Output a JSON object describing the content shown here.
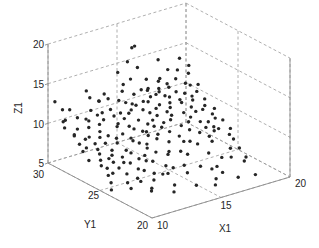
{
  "chart_data": {
    "type": "scatter3d",
    "title": "",
    "xlabel": "X1",
    "ylabel": "Y1",
    "zlabel": "Z1",
    "xlim": [
      10,
      20
    ],
    "ylim": [
      20,
      30
    ],
    "zlim": [
      5,
      20
    ],
    "xticks": [
      "10",
      "15",
      "20"
    ],
    "yticks": [
      "20",
      "25",
      "30"
    ],
    "zticks": [
      "5",
      "10",
      "15",
      "20"
    ],
    "grid": true,
    "marker_color": "#262626",
    "points": [
      [
        10.2,
        29.6,
        12.9
      ],
      [
        10.5,
        29.2,
        10.5
      ],
      [
        10.3,
        28.8,
        10.1
      ],
      [
        10.8,
        29.4,
        10.4
      ],
      [
        11.0,
        28.5,
        9.8
      ],
      [
        10.4,
        28.0,
        9.6
      ],
      [
        10.9,
        27.6,
        9.2
      ],
      [
        11.3,
        28.9,
        10.8
      ],
      [
        11.6,
        28.2,
        9.9
      ],
      [
        12.0,
        29.0,
        10.2
      ],
      [
        10.6,
        27.1,
        8.6
      ],
      [
        11.2,
        26.8,
        8.3
      ],
      [
        11.8,
        27.4,
        9.1
      ],
      [
        12.3,
        28.1,
        10.0
      ],
      [
        12.6,
        28.7,
        10.6
      ],
      [
        10.1,
        26.2,
        7.9
      ],
      [
        10.7,
        25.8,
        7.2
      ],
      [
        11.4,
        26.0,
        7.6
      ],
      [
        12.0,
        26.5,
        8.0
      ],
      [
        12.7,
        27.0,
        8.8
      ],
      [
        13.2,
        27.6,
        9.6
      ],
      [
        13.5,
        28.3,
        10.3
      ],
      [
        13.0,
        29.1,
        11.9
      ],
      [
        12.4,
        29.5,
        13.2
      ],
      [
        14.3,
        29.0,
        14.9
      ],
      [
        11.0,
        25.1,
        6.6
      ],
      [
        11.8,
        24.8,
        6.3
      ],
      [
        12.5,
        25.4,
        6.9
      ],
      [
        13.0,
        26.0,
        7.5
      ],
      [
        13.6,
        26.8,
        8.5
      ],
      [
        14.0,
        27.5,
        9.3
      ],
      [
        14.5,
        28.2,
        10.2
      ],
      [
        14.8,
        28.9,
        10.9
      ],
      [
        15.0,
        29.5,
        11.8
      ],
      [
        15.3,
        29.8,
        12.3
      ],
      [
        12.2,
        24.3,
        5.9
      ],
      [
        12.9,
        24.6,
        6.3
      ],
      [
        13.5,
        25.2,
        6.8
      ],
      [
        14.1,
        25.9,
        7.6
      ],
      [
        14.7,
        26.6,
        8.4
      ],
      [
        15.2,
        27.3,
        9.1
      ],
      [
        15.8,
        27.9,
        9.8
      ],
      [
        16.2,
        28.6,
        10.5
      ],
      [
        16.6,
        29.2,
        11.3
      ],
      [
        13.8,
        24.0,
        5.8
      ],
      [
        14.4,
        24.5,
        6.2
      ],
      [
        15.0,
        25.1,
        6.9
      ],
      [
        15.6,
        25.8,
        7.7
      ],
      [
        16.1,
        26.4,
        8.3
      ],
      [
        16.7,
        27.1,
        9.0
      ],
      [
        17.2,
        27.8,
        9.8
      ],
      [
        17.6,
        28.4,
        10.5
      ],
      [
        18.0,
        29.0,
        11.1
      ],
      [
        15.5,
        24.2,
        5.9
      ],
      [
        16.2,
        24.8,
        6.5
      ],
      [
        16.9,
        25.5,
        7.3
      ],
      [
        17.4,
        26.2,
        8.0
      ],
      [
        18.0,
        26.9,
        8.8
      ],
      [
        18.5,
        27.5,
        9.4
      ],
      [
        19.0,
        28.1,
        10.1
      ],
      [
        19.4,
        28.8,
        10.8
      ],
      [
        17.5,
        24.5,
        6.2
      ],
      [
        18.2,
        25.1,
        6.9
      ],
      [
        18.8,
        25.7,
        7.5
      ],
      [
        19.4,
        26.4,
        8.3
      ],
      [
        19.8,
        27.0,
        8.9
      ],
      [
        19.0,
        24.4,
        6.1
      ],
      [
        19.6,
        24.9,
        6.6
      ],
      [
        19.9,
        25.6,
        7.3
      ],
      [
        18.6,
        23.8,
        5.6
      ],
      [
        10.3,
        24.3,
        5.4
      ],
      [
        11.2,
        23.6,
        5.6
      ],
      [
        12.4,
        23.2,
        5.3
      ],
      [
        13.6,
        22.6,
        5.5
      ],
      [
        14.8,
        22.1,
        5.2
      ],
      [
        16.0,
        21.8,
        5.6
      ],
      [
        17.3,
        21.4,
        5.4
      ],
      [
        18.4,
        21.2,
        5.3
      ],
      [
        13.1,
        22.0,
        5.3
      ],
      [
        15.5,
        21.2,
        5.5
      ],
      [
        17.0,
        22.5,
        5.4
      ],
      [
        18.8,
        22.8,
        5.7
      ],
      [
        19.3,
        23.3,
        5.6
      ],
      [
        16.6,
        23.0,
        5.7
      ],
      [
        12.0,
        22.7,
        5.5
      ],
      [
        10.9,
        29.8,
        11.4
      ],
      [
        11.5,
        29.9,
        11.0
      ],
      [
        12.8,
        29.7,
        12.0
      ],
      [
        13.9,
        29.4,
        11.5
      ],
      [
        15.9,
        29.9,
        12.6
      ],
      [
        16.9,
        29.7,
        12.2
      ],
      [
        17.8,
        29.6,
        11.9
      ],
      [
        18.6,
        29.9,
        12.4
      ],
      [
        19.3,
        29.7,
        13.6
      ],
      [
        19.6,
        29.2,
        12.9
      ],
      [
        17.9,
        29.9,
        14.0
      ],
      [
        16.4,
        29.9,
        13.8
      ],
      [
        15.6,
        29.8,
        15.0
      ],
      [
        16.0,
        29.9,
        16.5
      ],
      [
        16.2,
        29.9,
        16.6
      ],
      [
        10.7,
        28.4,
        9.3
      ],
      [
        11.4,
        27.9,
        9.0
      ],
      [
        12.1,
        27.8,
        9.4
      ],
      [
        12.9,
        28.5,
        10.0
      ],
      [
        13.7,
        28.9,
        10.6
      ],
      [
        14.2,
        28.6,
        10.1
      ],
      [
        14.9,
        27.8,
        9.4
      ],
      [
        15.4,
        28.7,
        10.4
      ],
      [
        16.1,
        27.6,
        9.5
      ],
      [
        16.8,
        28.3,
        10.0
      ],
      [
        17.5,
        29.3,
        11.0
      ],
      [
        18.3,
        28.7,
        10.6
      ],
      [
        18.9,
        27.9,
        9.8
      ],
      [
        19.5,
        28.3,
        10.3
      ],
      [
        19.8,
        29.5,
        11.6
      ],
      [
        10.4,
        27.5,
        8.9
      ],
      [
        11.1,
        26.5,
        8.0
      ],
      [
        11.7,
        26.1,
        7.8
      ],
      [
        12.6,
        26.8,
        8.4
      ],
      [
        13.3,
        27.2,
        8.9
      ],
      [
        13.9,
        26.4,
        8.0
      ],
      [
        14.6,
        27.0,
        8.7
      ],
      [
        15.1,
        26.3,
        8.0
      ],
      [
        15.9,
        26.9,
        8.6
      ],
      [
        16.5,
        26.0,
        7.8
      ],
      [
        17.1,
        26.6,
        8.4
      ],
      [
        17.8,
        27.3,
        9.2
      ],
      [
        18.4,
        26.5,
        8.3
      ],
      [
        19.1,
        27.2,
        9.0
      ],
      [
        19.7,
        27.8,
        9.6
      ],
      [
        10.9,
        25.5,
        7.0
      ],
      [
        11.6,
        25.3,
        6.8
      ],
      [
        12.3,
        25.9,
        7.4
      ],
      [
        13.2,
        25.5,
        7.0
      ],
      [
        13.9,
        25.1,
        6.6
      ],
      [
        14.5,
        25.6,
        7.1
      ],
      [
        15.3,
        25.4,
        6.9
      ],
      [
        16.0,
        25.2,
        6.7
      ],
      [
        16.6,
        25.7,
        7.3
      ],
      [
        17.3,
        25.3,
        6.9
      ],
      [
        17.9,
        25.9,
        7.6
      ],
      [
        18.5,
        26.1,
        7.8
      ],
      [
        19.2,
        25.8,
        7.5
      ],
      [
        19.8,
        26.2,
        8.0
      ],
      [
        10.2,
        26.9,
        8.5
      ],
      [
        12.2,
        24.0,
        5.7
      ],
      [
        13.0,
        23.8,
        5.6
      ],
      [
        14.1,
        23.9,
        5.8
      ],
      [
        15.2,
        23.5,
        5.6
      ],
      [
        16.3,
        23.7,
        5.7
      ],
      [
        17.2,
        23.3,
        5.5
      ],
      [
        18.0,
        23.9,
        5.8
      ],
      [
        19.5,
        24.2,
        6.0
      ],
      [
        14.7,
        24.2,
        6.0
      ],
      [
        13.4,
        24.3,
        5.9
      ],
      [
        11.9,
        28.6,
        10.3
      ],
      [
        12.5,
        29.2,
        10.9
      ],
      [
        13.1,
        28.9,
        10.5
      ],
      [
        13.4,
        29.6,
        11.3
      ],
      [
        14.0,
        29.9,
        11.7
      ],
      [
        14.6,
        29.3,
        11.0
      ],
      [
        15.2,
        28.8,
        10.6
      ],
      [
        15.7,
        29.3,
        11.2
      ],
      [
        16.3,
        29.4,
        11.4
      ],
      [
        17.0,
        28.9,
        10.8
      ],
      [
        17.4,
        28.1,
        10.1
      ],
      [
        18.1,
        27.9,
        9.9
      ],
      [
        18.7,
        28.4,
        10.4
      ],
      [
        19.2,
        29.0,
        11.0
      ],
      [
        19.9,
        28.7,
        10.7
      ],
      [
        10.6,
        25.0,
        6.6
      ],
      [
        10.5,
        24.6,
        6.0
      ],
      [
        11.4,
        24.2,
        5.8
      ],
      [
        12.7,
        24.9,
        6.4
      ],
      [
        13.7,
        25.6,
        7.1
      ],
      [
        14.3,
        26.2,
        7.8
      ],
      [
        15.4,
        26.6,
        8.2
      ],
      [
        15.7,
        27.5,
        9.2
      ],
      [
        16.4,
        28.1,
        9.9
      ],
      [
        17.0,
        27.4,
        9.2
      ],
      [
        17.7,
        26.7,
        8.5
      ],
      [
        18.3,
        25.5,
        7.2
      ],
      [
        18.9,
        26.4,
        8.1
      ],
      [
        19.4,
        27.4,
        9.2
      ],
      [
        19.6,
        25.3,
        6.9
      ],
      [
        11.3,
        27.2,
        8.7
      ],
      [
        11.9,
        27.0,
        8.6
      ],
      [
        12.4,
        27.4,
        9.0
      ],
      [
        13.5,
        27.9,
        9.6
      ],
      [
        14.1,
        28.1,
        9.8
      ],
      [
        14.9,
        28.5,
        10.2
      ],
      [
        15.6,
        28.3,
        10.0
      ],
      [
        16.0,
        28.8,
        10.5
      ],
      [
        16.6,
        28.9,
        10.7
      ],
      [
        17.3,
        29.0,
        10.9
      ],
      [
        18.1,
        29.3,
        11.3
      ],
      [
        18.8,
        29.4,
        11.5
      ],
      [
        19.3,
        29.9,
        12.0
      ],
      [
        17.7,
        29.6,
        11.6
      ],
      [
        16.8,
        29.4,
        11.3
      ],
      [
        10.8,
        26.0,
        7.7
      ],
      [
        11.5,
        25.7,
        7.3
      ],
      [
        12.1,
        25.5,
        7.1
      ],
      [
        12.8,
        26.2,
        7.8
      ],
      [
        13.6,
        26.6,
        8.3
      ],
      [
        14.2,
        27.3,
        9.0
      ],
      [
        14.8,
        26.9,
        8.6
      ],
      [
        15.5,
        27.1,
        8.8
      ],
      [
        16.2,
        27.1,
        8.9
      ],
      [
        16.9,
        27.7,
        9.5
      ],
      [
        17.5,
        28.7,
        10.5
      ],
      [
        18.2,
        28.2,
        10.0
      ],
      [
        18.6,
        27.2,
        9.0
      ],
      [
        19.0,
        26.0,
        7.7
      ],
      [
        19.5,
        26.8,
        8.5
      ]
    ]
  },
  "axes": {
    "zlabel": "Z1",
    "ylabel": "Y1",
    "xlabel": "X1",
    "zticks": [
      "5",
      "10",
      "15",
      "20"
    ],
    "yticks": [
      "30",
      "25",
      "20"
    ],
    "xticks": [
      "10",
      "15",
      "20"
    ]
  }
}
